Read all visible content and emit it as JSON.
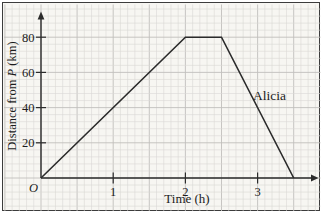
{
  "colors": {
    "paper": "#f7f6f2",
    "grid_minor": "#dad9d5",
    "grid_major": "#c1c0bc",
    "axis": "#2b2b2b",
    "line": "#2b2b2b",
    "text": "#1c1c1c",
    "border": "#3c3c3c"
  },
  "figure": {
    "ylabel_parts": {
      "pre": "Distance from ",
      "italic": "P",
      "post": " (km)"
    }
  },
  "chart_data": {
    "type": "line",
    "title": "",
    "xlabel": "Time (h)",
    "ylabel": "Distance from P (km)",
    "x_ticks": [
      1,
      2,
      3
    ],
    "y_ticks": [
      20,
      40,
      60,
      80
    ],
    "xlim": [
      0,
      3.85
    ],
    "ylim": [
      0,
      94
    ],
    "grid": true,
    "legend_position": "none",
    "origin_label": "O",
    "series": [
      {
        "name": "Alicia",
        "points": [
          [
            0,
            0
          ],
          [
            2,
            80
          ],
          [
            2.5,
            80
          ],
          [
            3.5,
            0
          ]
        ]
      }
    ],
    "annotations": [
      {
        "text": "Alicia",
        "x": 2.95,
        "y": 46
      }
    ]
  }
}
